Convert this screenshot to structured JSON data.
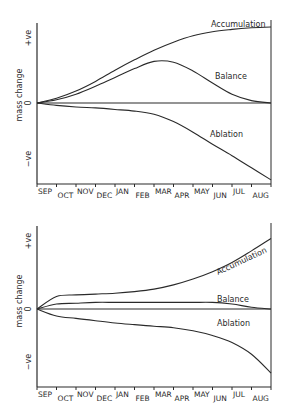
{
  "chart_data": [
    {
      "type": "line",
      "title": "",
      "xlabel": "",
      "ylabel": "mass change",
      "y_tick_labels": [
        "+ve",
        "0",
        "−ve"
      ],
      "ylim": [
        -1,
        1
      ],
      "grid": false,
      "legend": "inline labels",
      "categories": [
        "SEP",
        "OCT",
        "NOV",
        "DEC",
        "JAN",
        "FEB",
        "MAR",
        "APR",
        "MAY",
        "JUN",
        "JUL",
        "AUG"
      ],
      "x": [
        0,
        1,
        2,
        3,
        4,
        5,
        6,
        7,
        8,
        9,
        10,
        11,
        12
      ],
      "series": [
        {
          "name": "Accumulation",
          "values": [
            0,
            0.06,
            0.15,
            0.27,
            0.41,
            0.54,
            0.66,
            0.76,
            0.84,
            0.89,
            0.92,
            0.94,
            0.95
          ]
        },
        {
          "name": "Balance",
          "values": [
            0,
            0.04,
            0.11,
            0.21,
            0.32,
            0.43,
            0.52,
            0.51,
            0.4,
            0.25,
            0.11,
            0.03,
            0
          ]
        },
        {
          "name": "Ablation",
          "values": [
            0,
            -0.03,
            -0.05,
            -0.06,
            -0.08,
            -0.1,
            -0.14,
            -0.23,
            -0.36,
            -0.51,
            -0.65,
            -0.8,
            -0.95
          ]
        }
      ]
    },
    {
      "type": "line",
      "title": "",
      "xlabel": "",
      "ylabel": "mass change",
      "y_tick_labels": [
        "+ve",
        "0",
        "−ve"
      ],
      "ylim": [
        -1,
        1
      ],
      "grid": false,
      "legend": "inline labels",
      "categories": [
        "SEP",
        "OCT",
        "NOV",
        "DEC",
        "JAN",
        "FEB",
        "MAR",
        "APR",
        "MAY",
        "JUN",
        "JUL",
        "AUG"
      ],
      "x": [
        0,
        1,
        2,
        3,
        4,
        5,
        6,
        7,
        8,
        9,
        10,
        11,
        12
      ],
      "series": [
        {
          "name": "Accumulation",
          "values": [
            0,
            0.15,
            0.17,
            0.18,
            0.19,
            0.21,
            0.24,
            0.29,
            0.36,
            0.45,
            0.56,
            0.7,
            0.85
          ]
        },
        {
          "name": "Balance",
          "values": [
            0,
            0.06,
            0.07,
            0.08,
            0.08,
            0.08,
            0.08,
            0.08,
            0.08,
            0.08,
            0.06,
            0.02,
            0
          ]
        },
        {
          "name": "Ablation",
          "values": [
            0,
            -0.09,
            -0.12,
            -0.15,
            -0.18,
            -0.2,
            -0.22,
            -0.24,
            -0.28,
            -0.34,
            -0.43,
            -0.58,
            -0.82
          ]
        }
      ]
    }
  ],
  "style": {
    "line_color": "#2a2a2a",
    "background": "#ffffff"
  }
}
